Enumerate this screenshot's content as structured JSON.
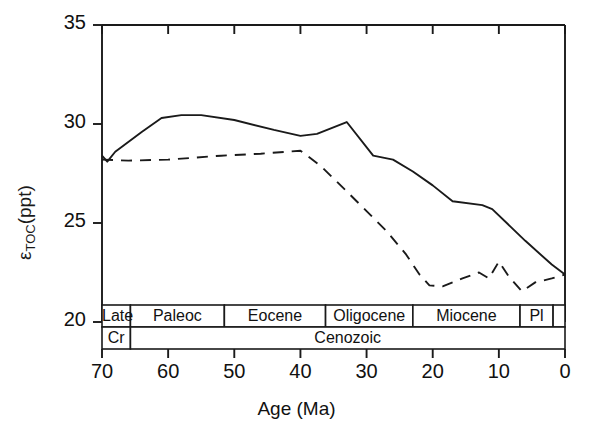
{
  "chart_data": {
    "type": "line",
    "title": "",
    "xlabel": "Age (Ma)",
    "ylabel": "εTOC(ppt)",
    "ylabel_main": "ε",
    "ylabel_sub": "TOC",
    "ylabel_unit": "(ppt)",
    "xlim": [
      70,
      0
    ],
    "ylim": [
      20,
      35
    ],
    "x_reversed": true,
    "xticks": [
      70,
      60,
      50,
      40,
      30,
      20,
      10,
      0
    ],
    "yticks": [
      20,
      25,
      30,
      35
    ],
    "grid": false,
    "legend": "none",
    "series": [
      {
        "name": "solid-curve",
        "style": "solid",
        "color": "#1a1a1a",
        "points": [
          [
            70.0,
            28.4
          ],
          [
            69.2,
            28.1
          ],
          [
            68.0,
            28.6
          ],
          [
            64.0,
            29.6
          ],
          [
            61.0,
            30.3
          ],
          [
            58.0,
            30.45
          ],
          [
            55.0,
            30.45
          ],
          [
            50.0,
            30.2
          ],
          [
            44.0,
            29.7
          ],
          [
            40.0,
            29.4
          ],
          [
            37.5,
            29.5
          ],
          [
            33.0,
            30.1
          ],
          [
            29.0,
            28.4
          ],
          [
            26.0,
            28.2
          ],
          [
            23.0,
            27.6
          ],
          [
            20.0,
            26.9
          ],
          [
            17.0,
            26.1
          ],
          [
            12.5,
            25.9
          ],
          [
            11.0,
            25.7
          ],
          [
            6.0,
            24.1
          ],
          [
            2.0,
            22.9
          ],
          [
            0.0,
            22.4
          ]
        ]
      },
      {
        "name": "dashed-curve",
        "style": "dashed",
        "color": "#1a1a1a",
        "points": [
          [
            70.0,
            28.2
          ],
          [
            66.0,
            28.15
          ],
          [
            60.0,
            28.2
          ],
          [
            52.0,
            28.4
          ],
          [
            46.0,
            28.5
          ],
          [
            42.0,
            28.6
          ],
          [
            40.0,
            28.65
          ],
          [
            37.0,
            27.9
          ],
          [
            33.0,
            26.6
          ],
          [
            30.0,
            25.6
          ],
          [
            27.0,
            24.6
          ],
          [
            24.0,
            23.4
          ],
          [
            22.0,
            22.4
          ],
          [
            20.5,
            21.85
          ],
          [
            18.5,
            21.8
          ],
          [
            15.5,
            22.2
          ],
          [
            13.0,
            22.5
          ],
          [
            11.5,
            22.2
          ],
          [
            10.0,
            23.05
          ],
          [
            8.5,
            22.3
          ],
          [
            6.5,
            21.55
          ],
          [
            4.5,
            22.0
          ],
          [
            2.0,
            22.2
          ],
          [
            0.0,
            22.4
          ]
        ]
      }
    ],
    "epoch_bands": {
      "row1_name": "epochs",
      "row1": [
        {
          "label": "Late",
          "from": 70,
          "to": 65.7
        },
        {
          "label": "Paleoc",
          "from": 65.7,
          "to": 51.5
        },
        {
          "label": "Eocene",
          "from": 51.5,
          "to": 36.2
        },
        {
          "label": "Oligocene",
          "from": 36.2,
          "to": 23.0
        },
        {
          "label": "Miocene",
          "from": 23.0,
          "to": 6.8
        },
        {
          "label": "Pl",
          "from": 6.8,
          "to": 1.8
        },
        {
          "label": "",
          "from": 1.8,
          "to": 0
        }
      ],
      "row2_name": "eras",
      "row2": [
        {
          "label": "Cr",
          "from": 70,
          "to": 65.7
        },
        {
          "label": "Cenozoic",
          "from": 65.7,
          "to": 0
        }
      ]
    }
  }
}
